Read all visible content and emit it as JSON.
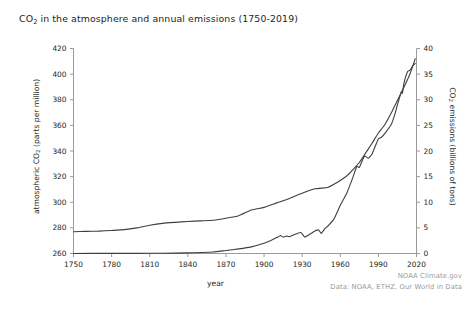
{
  "figure": {
    "title_main": "CO",
    "title_sub": "2",
    "title_rest": " in the atmosphere and annual emissions (1750-2019)",
    "background_color": "#ffffff",
    "line_color": "#3f3f3f"
  },
  "credits": {
    "line1": "NOAA Climate.gov",
    "line2": "Data: NOAA, ETHZ, Our World in Data",
    "color": "#9b9b9b"
  },
  "axes": {
    "x_label": "year",
    "y_left_label_main": "atmospheric CO",
    "y_left_label_sub": "2",
    "y_left_label_rest": " (parts per million)",
    "y_right_label_main": "CO",
    "y_right_label_sub": "2",
    "y_right_label_rest": " emissions (billions of tons)",
    "x_ticks": [
      "1750",
      "1780",
      "1810",
      "1840",
      "1870",
      "1900",
      "1930",
      "1960",
      "1990",
      "2020"
    ],
    "y_left_ticks": [
      "420",
      "400",
      "380",
      "360",
      "340",
      "320",
      "300",
      "280",
      "260"
    ],
    "y_right_ticks": [
      "40",
      "35",
      "30",
      "25",
      "20",
      "15",
      "10",
      "5",
      "0"
    ]
  },
  "chart_data": {
    "type": "line",
    "title": "CO2 in the atmosphere and annual emissions (1750-2019)",
    "xlabel": "year",
    "ylabel": "atmospheric CO2 (parts per million)",
    "ylabel_secondary": "CO2 emissions (billions of tons)",
    "xlim": [
      1750,
      2020
    ],
    "ylim": [
      260,
      420
    ],
    "ylim_secondary": [
      0,
      40
    ],
    "grid": false,
    "legend": "none",
    "annotations": [
      "NOAA Climate.gov",
      "Data: NOAA, ETHZ, Our World in Data"
    ],
    "series": [
      {
        "name": "atmospheric CO2 concentration",
        "axis": "left",
        "units": "parts per million",
        "x": [
          1750,
          1760,
          1770,
          1780,
          1790,
          1800,
          1810,
          1820,
          1830,
          1840,
          1850,
          1860,
          1870,
          1880,
          1890,
          1900,
          1910,
          1920,
          1930,
          1940,
          1950,
          1955,
          1960,
          1965,
          1970,
          1975,
          1980,
          1985,
          1990,
          1995,
          2000,
          2005,
          2010,
          2015,
          2019
        ],
        "values": [
          277.0,
          277.3,
          277.5,
          278.0,
          278.6,
          280.0,
          282.0,
          283.5,
          284.3,
          285.0,
          285.5,
          286.0,
          287.5,
          289.5,
          294.0,
          296.0,
          299.5,
          303.0,
          307.0,
          310.5,
          311.5,
          314.0,
          317.0,
          320.5,
          325.5,
          331.0,
          338.5,
          346.0,
          354.0,
          360.5,
          369.5,
          379.5,
          389.5,
          400.5,
          412.0
        ]
      },
      {
        "name": "annual CO2 emissions",
        "axis": "right",
        "units": "billions of tons",
        "x": [
          1750,
          1780,
          1800,
          1820,
          1840,
          1850,
          1860,
          1870,
          1880,
          1890,
          1900,
          1905,
          1910,
          1913,
          1915,
          1918,
          1920,
          1925,
          1929,
          1932,
          1935,
          1940,
          1943,
          1945,
          1948,
          1950,
          1955,
          1960,
          1965,
          1970,
          1973,
          1975,
          1979,
          1982,
          1985,
          1990,
          1992,
          1995,
          2000,
          2003,
          2005,
          2008,
          2009,
          2010,
          2013,
          2015,
          2017,
          2019
        ],
        "values": [
          0.01,
          0.02,
          0.03,
          0.05,
          0.12,
          0.2,
          0.3,
          0.6,
          0.9,
          1.3,
          2.0,
          2.5,
          3.1,
          3.5,
          3.2,
          3.4,
          3.3,
          3.8,
          4.1,
          3.2,
          3.6,
          4.4,
          4.6,
          3.9,
          4.9,
          5.3,
          6.7,
          9.4,
          11.7,
          14.9,
          17.0,
          16.8,
          19.0,
          18.6,
          19.4,
          22.4,
          22.6,
          23.4,
          25.1,
          27.2,
          29.0,
          31.5,
          31.3,
          33.1,
          35.5,
          35.8,
          36.6,
          37.1
        ]
      }
    ]
  }
}
